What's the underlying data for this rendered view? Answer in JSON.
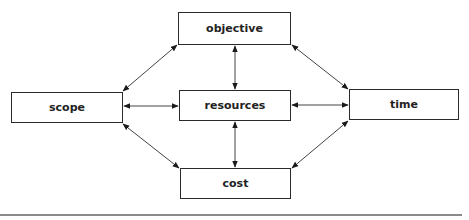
{
  "diagram": {
    "nodes": {
      "objective": {
        "label": "objective",
        "x": 178,
        "y": 12,
        "w": 113,
        "h": 33
      },
      "scope": {
        "label": "scope",
        "x": 11,
        "y": 92,
        "w": 112,
        "h": 31
      },
      "resources": {
        "label": "resources",
        "x": 179,
        "y": 90,
        "w": 112,
        "h": 31
      },
      "time": {
        "label": "time",
        "x": 349,
        "y": 89,
        "w": 110,
        "h": 31
      },
      "cost": {
        "label": "cost",
        "x": 180,
        "y": 168,
        "w": 111,
        "h": 31
      }
    },
    "edges": [
      {
        "from": "objective",
        "to": "scope",
        "type": "bidirectional"
      },
      {
        "from": "objective",
        "to": "resources",
        "type": "bidirectional"
      },
      {
        "from": "objective",
        "to": "time",
        "type": "bidirectional"
      },
      {
        "from": "scope",
        "to": "resources",
        "type": "bidirectional"
      },
      {
        "from": "resources",
        "to": "time",
        "type": "bidirectional"
      },
      {
        "from": "scope",
        "to": "cost",
        "type": "bidirectional"
      },
      {
        "from": "resources",
        "to": "cost",
        "type": "bidirectional"
      },
      {
        "from": "time",
        "to": "cost",
        "type": "bidirectional"
      }
    ],
    "colors": {
      "stroke": "#2a2a2a",
      "arrow": "#1a1a1a",
      "rule": "#8a8a8a"
    }
  }
}
